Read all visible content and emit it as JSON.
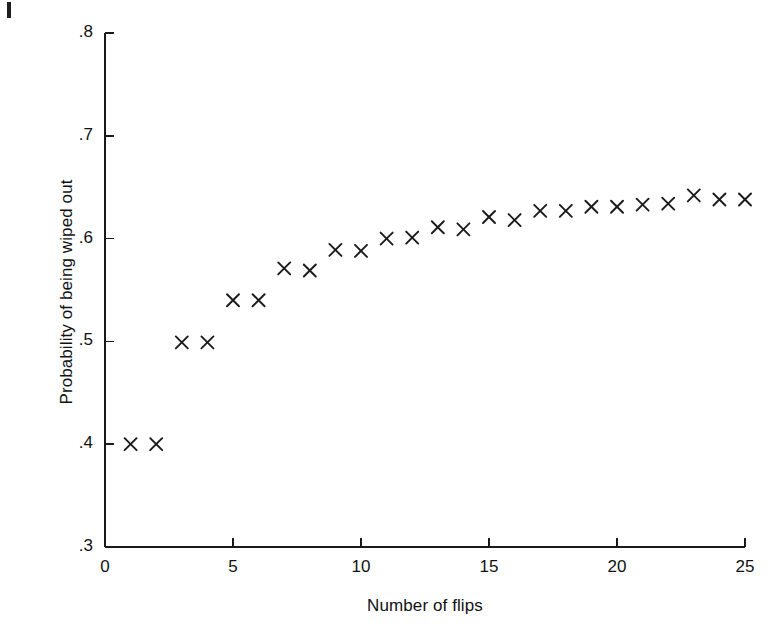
{
  "figure": {
    "background_color": "#ffffff",
    "ink_color": "#1a1a1a",
    "page_edge_mark": "page-edge-artifact"
  },
  "chart_data": {
    "type": "scatter",
    "title": "",
    "xlabel": "Number of flips",
    "ylabel": "Probability of being wiped out",
    "xlim": [
      0,
      25
    ],
    "ylim": [
      0.3,
      0.8
    ],
    "xticks": [
      0,
      5,
      10,
      15,
      20,
      25
    ],
    "xtick_labels": [
      "0",
      "5",
      "10",
      "15",
      "20",
      "25"
    ],
    "yticks": [
      0.3,
      0.4,
      0.5,
      0.6,
      0.7,
      0.8
    ],
    "ytick_labels": [
      ".3",
      ".4",
      ".5",
      ".6",
      ".7",
      ".8"
    ],
    "grid": false,
    "legend": "none",
    "marker": "x",
    "marker_color": "#1a1a1a",
    "series": [
      {
        "name": "Probability of being wiped out",
        "x": [
          1,
          2,
          3,
          4,
          5,
          6,
          7,
          8,
          9,
          10,
          11,
          12,
          13,
          14,
          15,
          16,
          17,
          18,
          19,
          20,
          21,
          22,
          23,
          24,
          25
        ],
        "values": [
          0.4,
          0.4,
          0.499,
          0.499,
          0.54,
          0.54,
          0.571,
          0.569,
          0.589,
          0.588,
          0.6,
          0.601,
          0.611,
          0.609,
          0.621,
          0.618,
          0.627,
          0.627,
          0.631,
          0.631,
          0.633,
          0.634,
          0.642,
          0.638,
          0.638
        ]
      }
    ]
  }
}
